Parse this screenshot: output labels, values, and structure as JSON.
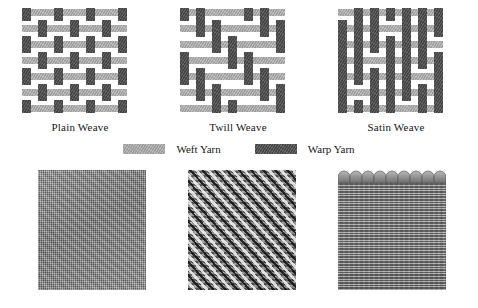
{
  "figure": {
    "background_color": "#ffffff"
  },
  "colors": {
    "weft_yarn": "#ababab",
    "warp_yarn": "#4c4c4c",
    "background": "#ffffff",
    "text": "#161616"
  },
  "weaves": [
    {
      "id": "plain-weave",
      "caption": "Plain Weave",
      "grid": 7,
      "description": "One-over-one-under interlacing"
    },
    {
      "id": "twill-weave",
      "caption": "Twill Weave",
      "grid": 7,
      "description": "Diagonal stepped interlacing"
    },
    {
      "id": "satin-weave",
      "caption": "Satin Weave",
      "grid": 7,
      "description": "Long floats with scattered binding points"
    }
  ],
  "legend": {
    "items": [
      {
        "id": "weft",
        "label": "Weft Yarn",
        "color": "#ababab"
      },
      {
        "id": "warp",
        "label": "Warp Yarn",
        "color": "#4c4c4c"
      }
    ]
  },
  "photos": [
    {
      "id": "plain-weave-photo",
      "texture": "plain",
      "alt": "Plain weave fabric micrograph"
    },
    {
      "id": "twill-weave-photo",
      "texture": "twill",
      "alt": "Twill weave fabric micrograph"
    },
    {
      "id": "satin-weave-photo",
      "texture": "satin",
      "alt": "Satin weave fabric micrograph"
    }
  ]
}
